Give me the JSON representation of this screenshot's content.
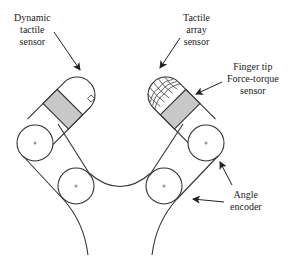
{
  "diagram": {
    "type": "robot-gripper-sensor-schematic",
    "labels": {
      "dynamic_tactile": [
        "Dynamic",
        "tactile",
        "sensor"
      ],
      "tactile_array": [
        "Tactile",
        "array",
        "sensor"
      ],
      "force_torque": [
        "Finger tip",
        "Force-torque",
        "sensor"
      ],
      "angle_encoder": [
        "Angle",
        "encoder"
      ]
    },
    "colors": {
      "line": "#333333",
      "sensor_fill": "#c8c8c8",
      "center_dot": "#999999",
      "background": "#ffffff"
    },
    "components": [
      {
        "name": "left-finger",
        "parts": [
          "fingertip",
          "force-torque-band",
          "dynamic-tactile-sensor",
          "upper-joint",
          "lower-joint"
        ]
      },
      {
        "name": "right-finger",
        "parts": [
          "fingertip",
          "force-torque-band",
          "tactile-array",
          "upper-joint",
          "lower-joint"
        ]
      },
      {
        "name": "palm-arc"
      },
      {
        "name": "base-curves"
      }
    ]
  }
}
